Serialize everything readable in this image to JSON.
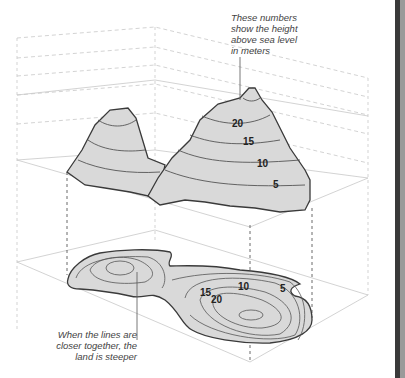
{
  "diagram": {
    "annotations": {
      "top": {
        "lines": [
          "These numbers",
          "show the height",
          "above sea level",
          "in meters"
        ]
      },
      "bottom": {
        "lines": [
          "When the lines are",
          "closer together, the",
          "land is steeper"
        ]
      }
    },
    "terrain_3d": {
      "contour_labels": [
        "20",
        "15",
        "10",
        "5"
      ]
    },
    "map_2d": {
      "contour_labels": [
        "15",
        "20",
        "10",
        "5"
      ]
    },
    "colors": {
      "terrain_fill": "#d9d9d9",
      "outline": "#3a3a3a",
      "contour": "#555555",
      "grid": "#c8c8c8",
      "dashed": "#555555",
      "frame_bar": "#3a3a3a"
    }
  }
}
